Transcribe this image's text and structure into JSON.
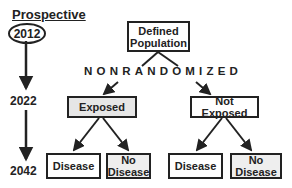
{
  "diagram": {
    "heading": "Prospective",
    "timeline": {
      "years": [
        "2012",
        "2022",
        "2042"
      ],
      "start_year_highlighted": "2012"
    },
    "nodes": {
      "root": "Defined Population",
      "assignment_label": "NONRANDOMIZED",
      "exposed": "Exposed",
      "not_exposed": "Not Exposed",
      "exposed_disease": "Disease",
      "exposed_no_disease": "No Disease",
      "not_exposed_disease": "Disease",
      "not_exposed_no_disease": "No Disease"
    },
    "colors": {
      "exposed_fill": "#e6e6e6",
      "no_disease_fill": "#eeeeee",
      "default_fill": "#ffffff",
      "stroke": "#222222"
    }
  }
}
